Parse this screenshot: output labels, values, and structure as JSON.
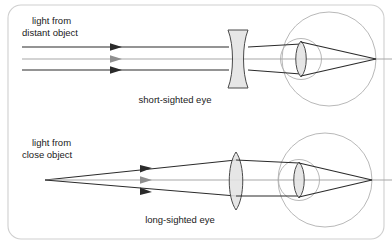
{
  "figure": {
    "width": 392,
    "height": 244,
    "background_color": "#ffffff",
    "border_color": "#cfcfcf"
  },
  "diagrams": [
    {
      "id": "short-sighted",
      "source_label_line1": "light from",
      "source_label_line2": "distant object",
      "caption": "short-sighted eye",
      "correcting_lens": "concave",
      "ray_type": "parallel",
      "ray_count": 3,
      "eye_lens": "convex"
    },
    {
      "id": "long-sighted",
      "source_label_line1": "light from",
      "source_label_line2": "close object",
      "caption": "long-sighted eye",
      "correcting_lens": "convex",
      "ray_type": "diverging",
      "ray_count": 3,
      "eye_lens": "convex"
    }
  ],
  "colors": {
    "ray": "#2b2b2b",
    "axis": "#a8a8a8",
    "eye_outline": "#b0b0b0",
    "lens_fill": "#e2e2e2",
    "lens_stroke": "#4a4a4a",
    "text": "#1a1a1a"
  }
}
